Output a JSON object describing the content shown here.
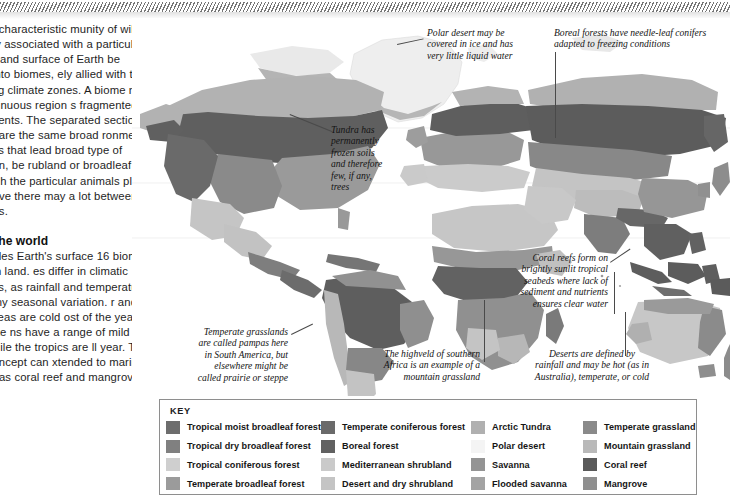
{
  "article": {
    "paragraph_1": "ome is a characteristic\nmunity of wildlife that is\nely associated with a particular\nate. The land surface of Earth\nbe divided into biomes,\nely allied with the globe's\nng climate zones. A biome\nnot fill a continuous region\ns fragmented across\ninents. The separated sections\nbiome share the same broad\nronmental conditions that lead\nbroad type of vegetation, be\nrubland or broadleaf forest,\nugh the particular animals\nplants that survive there may\na lot between continents.",
    "heading": "mes of the world",
    "paragraph_2": "map divides Earth's surface\n16 biomes, mostly on land.\nes differ in climatic conditions,\nas rainfall and temperature\ne, plus any seasonal variation.\nr and boreal areas are cold\nost of the year. Temperate\nns have a range of mild\nitions, while the tropics are\nll year. The biome concept can\nxtended to marine habitats,\nas coral reef and mangrove"
  },
  "annotations": [
    {
      "name": "polar-desert-callout",
      "text": "Polar desert may be\ncovered in ice and has\nvery little liquid water"
    },
    {
      "name": "boreal-forest-callout",
      "text": "Boreal forests have needle-leaf conifers\nadapted to freezing conditions"
    },
    {
      "name": "tundra-callout",
      "text": "Tundra has\npermanently\nfrozen soils\nand therefore\nfew, if any,\ntrees"
    },
    {
      "name": "coral-reef-callout",
      "text": "Coral reefs form on\nbrightly sunlit tropical\nseabeds where lack of\nsediment and nutrients\nensures clear water"
    },
    {
      "name": "temperate-grassland-callout",
      "text": "Temperate grasslands\nare called pampas here\nin South America, but\nelsewhere might be\ncalled prairie or steppe"
    },
    {
      "name": "highveld-callout",
      "text": "The highveld of southern\nAfrica is an example of a\nmountain grassland"
    },
    {
      "name": "desert-callout",
      "text": "Deserts are defined by\nrainfall and may be hot (as in\nAustralia), temperate, or cold"
    }
  ],
  "key": {
    "title": "KEY",
    "columns": [
      [
        {
          "label": "Tropical moist broadleaf forest",
          "color": "#6d6d6d"
        },
        {
          "label": "Tropical dry broadleaf forest",
          "color": "#808080"
        },
        {
          "label": "Tropical coniferous forest",
          "color": "#cfcfcf"
        },
        {
          "label": "Temperate broadleaf forest",
          "color": "#9b9b9b"
        }
      ],
      [
        {
          "label": "Temperate coniferous forest",
          "color": "#6a6a6a"
        },
        {
          "label": "Boreal forest",
          "color": "#616161"
        },
        {
          "label": "Mediterranean shrubland",
          "color": "#cacaca"
        },
        {
          "label": "Desert and dry shrubland",
          "color": "#c4c4c4"
        }
      ],
      [
        {
          "label": "Arctic Tundra",
          "color": "#b0b0b0"
        },
        {
          "label": "Polar desert",
          "color": "#f4f4f4"
        },
        {
          "label": "Savanna",
          "color": "#949494"
        },
        {
          "label": "Flooded savanna",
          "color": "#a3a3a3"
        }
      ],
      [
        {
          "label": "Temperate grassland",
          "color": "#8a8a8a"
        },
        {
          "label": "Mountain grassland",
          "color": "#b9b9b9"
        },
        {
          "label": "Coral reef",
          "color": "#5a5a5a"
        },
        {
          "label": "Mangrove",
          "color": "#8f8f8f"
        }
      ]
    ]
  }
}
